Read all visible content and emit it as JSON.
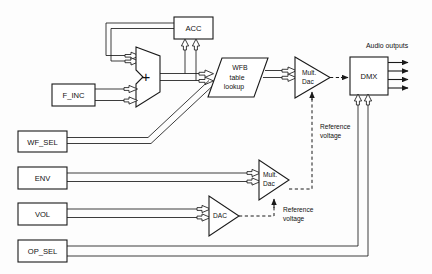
{
  "diagram": {
    "background_color": "#fdfdfd",
    "line_color": "#1a1a1a",
    "blocks": [
      {
        "id": "acc",
        "label": "ACC",
        "shape": "rect"
      },
      {
        "id": "f_inc",
        "label": "F_INC",
        "shape": "rect"
      },
      {
        "id": "wf_sel",
        "label": "WF_SEL",
        "shape": "rect"
      },
      {
        "id": "env",
        "label": "ENV",
        "shape": "rect"
      },
      {
        "id": "vol",
        "label": "VOL",
        "shape": "rect"
      },
      {
        "id": "op_sel",
        "label": "OP_SEL",
        "shape": "rect"
      },
      {
        "id": "dmx",
        "label": "DMX",
        "shape": "rect"
      }
    ],
    "adder": {
      "id": "adder",
      "label": "+",
      "shape": "mux-trapezoid"
    },
    "wfb": {
      "id": "wfb",
      "shape": "parallelogram",
      "line1": "WFB",
      "line2": "table",
      "line3": "lookup"
    },
    "mult_dac_top": {
      "id": "mult-dac-top",
      "shape": "triangle",
      "line1": "Mult.",
      "line2": "Dac"
    },
    "mult_dac_mid": {
      "id": "mult-dac-mid",
      "shape": "triangle",
      "line1": "Mult.",
      "line2": "Dac"
    },
    "dac": {
      "id": "dac",
      "shape": "triangle",
      "label": "DAC"
    },
    "annotations": [
      {
        "id": "audio-outputs",
        "text": "Audio outputs"
      },
      {
        "id": "ref-voltage-top",
        "line1": "Reference",
        "line2": "voltage"
      },
      {
        "id": "ref-voltage-bottom",
        "line1": "Reference",
        "line2": "voltage"
      }
    ],
    "audio_output_count": 4
  }
}
